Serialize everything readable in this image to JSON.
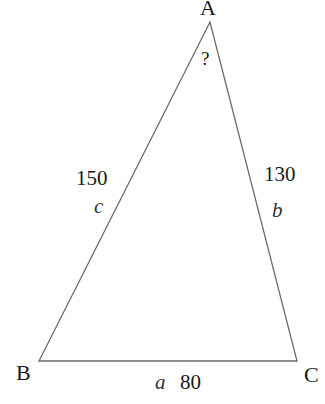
{
  "diagram": {
    "type": "triangle",
    "vertices": {
      "A": {
        "label": "A",
        "x": 210,
        "y": 22
      },
      "B": {
        "label": "B",
        "x": 39,
        "y": 361
      },
      "C": {
        "label": "C",
        "x": 297,
        "y": 361
      }
    },
    "sides": {
      "a": {
        "variable": "a",
        "length": "80"
      },
      "b": {
        "variable": "b",
        "length": "130"
      },
      "c": {
        "variable": "c",
        "length": "150"
      }
    },
    "angle_A": {
      "label": "?"
    },
    "colors": {
      "stroke": "#6b6b6b",
      "text": "#1a1a1a"
    }
  }
}
